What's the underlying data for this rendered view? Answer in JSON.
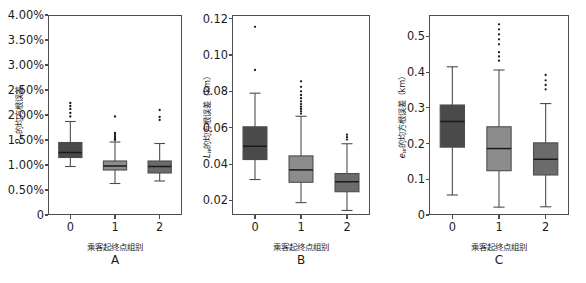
{
  "figure": {
    "kind": "boxplot-figure",
    "panel_count": 3,
    "background": "#ffffff",
    "box_colors": [
      "#4a4a4a",
      "#8c8c8c",
      "#6b6b6b"
    ],
    "line_color": "#4d4d4d",
    "median_color": "#1a1a1a"
  },
  "panels": {
    "A": {
      "letter": "A",
      "xlabel": "乘客起终点组别",
      "ylabel_prefix": "P",
      "ylabel_sub": "w",
      "ylabel_rest": "的均方根误差",
      "ylabel_full": "Pw的均方根误差",
      "xticks": [
        "0",
        "1",
        "2"
      ],
      "yticks": [
        "0",
        "0.50%",
        "1.00%",
        "1.50%",
        "2.00%",
        "2.50%",
        "3.00%",
        "3.50%",
        "4.00%"
      ]
    },
    "B": {
      "letter": "B",
      "xlabel": "乘客起终点组别",
      "ylabel_prefix": "L",
      "ylabel_sub": "w",
      "ylabel_rest": "的均方根误差（km）",
      "ylabel_full": "Lw的均方根误差（km）",
      "xticks": [
        "0",
        "1",
        "2"
      ],
      "yticks": [
        "0.02",
        "0.04",
        "0.06",
        "0.08",
        "0.10",
        "0.12"
      ]
    },
    "C": {
      "letter": "C",
      "xlabel": "乘客起终点组别",
      "ylabel_prefix": "e",
      "ylabel_sub": "w",
      "ylabel_rest": "的均方根误差（km）",
      "ylabel_full": "ew的均方根误差（km）",
      "xticks": [
        "0",
        "1",
        "2"
      ],
      "yticks": [
        "0",
        "0.1",
        "0.2",
        "0.3",
        "0.4",
        "0.5"
      ]
    }
  },
  "chart_data": [
    {
      "type": "box",
      "panel": "A",
      "title": "A",
      "xlabel": "乘客起终点组别",
      "ylabel": "Pw的均方根误差",
      "unit": "percent",
      "ylim": [
        0,
        4.0
      ],
      "yticks": [
        0,
        0.5,
        1.0,
        1.5,
        2.0,
        2.5,
        3.0,
        3.5,
        4.0
      ],
      "ytick_labels": [
        "0",
        "0.50%",
        "1.00%",
        "1.50%",
        "2.00%",
        "2.50%",
        "3.00%",
        "3.50%",
        "4.00%"
      ],
      "categories": [
        "0",
        "1",
        "2"
      ],
      "grid": false,
      "legend": "none",
      "boxes": [
        {
          "category": "0",
          "whisker_low": 0.97,
          "q1": 1.15,
          "median": 1.25,
          "q3": 1.45,
          "whisker_high": 1.87,
          "outliers": [
            1.97,
            2.04,
            2.12,
            2.18,
            2.24
          ],
          "color": "#4a4a4a"
        },
        {
          "category": "1",
          "whisker_low": 0.63,
          "q1": 0.9,
          "median": 0.98,
          "q3": 1.08,
          "whisker_high": 1.46,
          "outliers": [
            1.5,
            1.53,
            1.56,
            1.6,
            1.64,
            1.97
          ],
          "color": "#8c8c8c"
        },
        {
          "category": "2",
          "whisker_low": 0.68,
          "q1": 0.84,
          "median": 0.97,
          "q3": 1.08,
          "whisker_high": 1.43,
          "outliers": [
            1.9,
            1.96,
            2.1
          ],
          "color": "#6b6b6b"
        }
      ]
    },
    {
      "type": "box",
      "panel": "B",
      "title": "B",
      "xlabel": "乘客起终点组别",
      "ylabel": "Lw的均方根误差（km）",
      "unit": "km",
      "ylim": [
        0.012,
        0.122
      ],
      "yticks": [
        0.02,
        0.04,
        0.06,
        0.08,
        0.1,
        0.12
      ],
      "ytick_labels": [
        "0.02",
        "0.04",
        "0.06",
        "0.08",
        "0.10",
        "0.12"
      ],
      "categories": [
        "0",
        "1",
        "2"
      ],
      "grid": false,
      "legend": "none",
      "boxes": [
        {
          "category": "0",
          "whisker_low": 0.0315,
          "q1": 0.0425,
          "median": 0.0498,
          "q3": 0.0605,
          "whisker_high": 0.079,
          "outliers": [
            0.0918,
            0.1155
          ],
          "color": "#4a4a4a"
        },
        {
          "category": "1",
          "whisker_low": 0.0188,
          "q1": 0.03,
          "median": 0.0368,
          "q3": 0.0445,
          "whisker_high": 0.0663,
          "outliers": [
            0.0678,
            0.069,
            0.0703,
            0.0716,
            0.073,
            0.0745,
            0.0762,
            0.078,
            0.08,
            0.0825,
            0.0855
          ],
          "color": "#8c8c8c"
        },
        {
          "category": "2",
          "whisker_low": 0.0145,
          "q1": 0.0248,
          "median": 0.0303,
          "q3": 0.0348,
          "whisker_high": 0.0512,
          "outliers": [
            0.0535,
            0.0548,
            0.0562
          ],
          "color": "#6b6b6b"
        }
      ]
    },
    {
      "type": "box",
      "panel": "C",
      "title": "C",
      "xlabel": "乘客起终点组别",
      "ylabel": "ew的均方根误差（km）",
      "unit": "km",
      "ylim": [
        0,
        0.56
      ],
      "yticks": [
        0,
        0.1,
        0.2,
        0.3,
        0.4,
        0.5
      ],
      "ytick_labels": [
        "0",
        "0.1",
        "0.2",
        "0.3",
        "0.4",
        "0.5"
      ],
      "categories": [
        "0",
        "1",
        "2"
      ],
      "grid": false,
      "legend": "none",
      "boxes": [
        {
          "category": "0",
          "whisker_low": 0.056,
          "q1": 0.19,
          "median": 0.262,
          "q3": 0.308,
          "whisker_high": 0.415,
          "outliers": [],
          "color": "#4a4a4a"
        },
        {
          "category": "1",
          "whisker_low": 0.022,
          "q1": 0.124,
          "median": 0.186,
          "q3": 0.247,
          "whisker_high": 0.406,
          "outliers": [
            0.432,
            0.444,
            0.456,
            0.478,
            0.492,
            0.506,
            0.52,
            0.534
          ],
          "color": "#8c8c8c"
        },
        {
          "category": "2",
          "whisker_low": 0.023,
          "q1": 0.112,
          "median": 0.156,
          "q3": 0.202,
          "whisker_high": 0.312,
          "outliers": [
            0.352,
            0.364,
            0.377,
            0.392
          ],
          "color": "#6b6b6b"
        }
      ]
    }
  ]
}
